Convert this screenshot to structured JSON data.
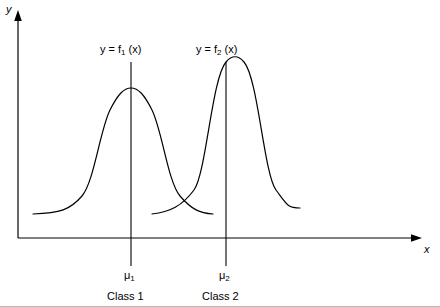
{
  "figure": {
    "axes": {
      "y_label": "y",
      "x_label": "x"
    },
    "curves": [
      {
        "id": "curve-1",
        "label_prefix": "y = f",
        "label_subscript": "1",
        "label_suffix": " (x)",
        "mean_label_prefix": "μ",
        "mean_label_subscript": "1",
        "class_label": "Class 1"
      },
      {
        "id": "curve-2",
        "label_prefix": "y = f",
        "label_subscript": "2",
        "label_suffix": " (x)",
        "mean_label_prefix": "μ",
        "mean_label_subscript": "2",
        "class_label": "Class 2"
      }
    ],
    "colors": {
      "stroke": "#000000",
      "background": "#ffffff",
      "rule": "#b9b9b9"
    }
  }
}
